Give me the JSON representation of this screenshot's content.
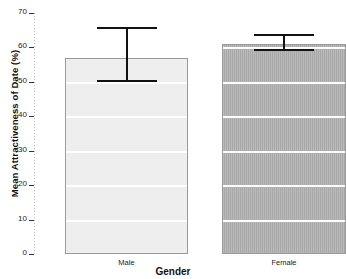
{
  "chart_data": {
    "type": "bar",
    "title": "",
    "xlabel": "Gender",
    "ylabel": "Mean Attractiveness of Date (%)",
    "categories": [
      "Male",
      "Female"
    ],
    "values": [
      57,
      61
    ],
    "series": [
      {
        "name": "Mean Attractiveness of Date (%)",
        "values": [
          57,
          61
        ],
        "error_low": [
          50,
          59
        ],
        "error_high": [
          66,
          64
        ]
      }
    ],
    "ylim": [
      0,
      70
    ],
    "yticks": [
      0,
      10,
      20,
      30,
      40,
      50,
      60,
      70
    ],
    "ytick_labels": [
      "0",
      "10",
      "20",
      "30",
      "40",
      "50",
      "60",
      "70"
    ],
    "grid": true,
    "grid_orientation": "horizontal",
    "legend": "none",
    "bar_colors": [
      "#EFEFEF",
      "#ADADAD"
    ],
    "bar_edge_color": "#9A9A9A",
    "error_bar_color": "#111111"
  },
  "axes": {
    "y_title": "Mean Attractiveness of Date (%)",
    "x_title": "Gender"
  }
}
